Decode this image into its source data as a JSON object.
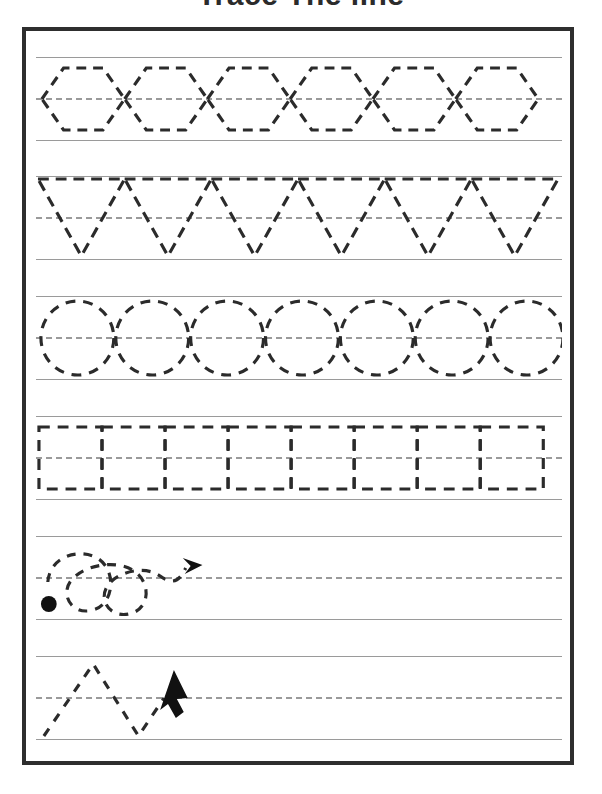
{
  "worksheet": {
    "title": "Trace The line",
    "page_border_color": "#2e2e2e",
    "guide_line_color": "#9a9a9a",
    "trace_dash_color": "#2b2b2b",
    "paper_color": "#ffffff"
  },
  "rows": [
    {
      "id": "row-1",
      "shape_name": "hexagon",
      "shape_label": "Hexagons",
      "count": 6,
      "dash_pattern": "10 7",
      "has_start_dot": false,
      "has_arrow": false
    },
    {
      "id": "row-2",
      "shape_name": "triangle-down",
      "shape_label": "Downward Triangles",
      "count": 6,
      "dash_pattern": "11 7",
      "has_start_dot": false,
      "has_arrow": false
    },
    {
      "id": "row-3",
      "shape_name": "oval",
      "shape_label": "Ovals",
      "count": 7,
      "dash_pattern": "10 8",
      "has_start_dot": false,
      "has_arrow": false
    },
    {
      "id": "row-4",
      "shape_name": "rectangle",
      "shape_label": "Rectangles",
      "count": 8,
      "dash_pattern": "11 8",
      "has_start_dot": false,
      "has_arrow": false
    },
    {
      "id": "row-5",
      "shape_name": "loop-curl",
      "shape_label": "Loops",
      "count": 2,
      "dash_pattern": "9 8",
      "has_start_dot": true,
      "has_arrow": true,
      "arrow_direction": "right"
    },
    {
      "id": "row-6",
      "shape_name": "zigzag",
      "shape_label": "Zigzag",
      "count": 1,
      "dash_pattern": "9 9",
      "has_start_dot": false,
      "has_arrow": true,
      "arrow_direction": "up-right"
    }
  ]
}
